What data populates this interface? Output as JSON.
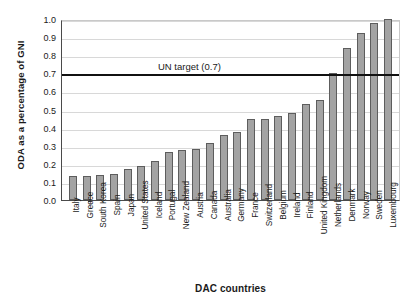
{
  "chart_data": {
    "type": "bar",
    "title": "",
    "xlabel": "DAC countries",
    "ylabel": "ODA as a percentage of GNI",
    "ylim": [
      0.0,
      1.0
    ],
    "yticks": [
      "0.0",
      "0.1",
      "0.2",
      "0.3",
      "0.4",
      "0.5",
      "0.6",
      "0.7",
      "0.8",
      "0.9",
      "1.0"
    ],
    "grid": true,
    "legend": "none",
    "categories": [
      "Italy",
      "Greece",
      "South Korea",
      "Spain",
      "Japan",
      "United States",
      "Iceland",
      "Portugal",
      "New Zealand",
      "Austria",
      "Canada",
      "Australia",
      "Germany",
      "France",
      "Switzerland",
      "Belgium",
      "Ireland",
      "Finland",
      "United Kingdom",
      "Netherlands",
      "Denmark",
      "Norway",
      "Sweden",
      "Luxembourg"
    ],
    "values": [
      0.13,
      0.13,
      0.14,
      0.145,
      0.17,
      0.19,
      0.215,
      0.265,
      0.275,
      0.28,
      0.315,
      0.36,
      0.375,
      0.445,
      0.45,
      0.465,
      0.48,
      0.53,
      0.555,
      0.7,
      0.84,
      0.92,
      0.98,
      1.0
    ],
    "annotations": [
      {
        "label": "UN target (0.7)",
        "value": 0.7,
        "kind": "horizontal-reference-line"
      }
    ]
  },
  "colors": {
    "bar_fill": "#a3a3a3",
    "bar_stroke": "#5d5d5d",
    "gridline": "#d8d8d8",
    "axis": "#4a4a4a",
    "target_line": "#111111",
    "background": "#ffffff",
    "text": "#1a1a1a"
  }
}
